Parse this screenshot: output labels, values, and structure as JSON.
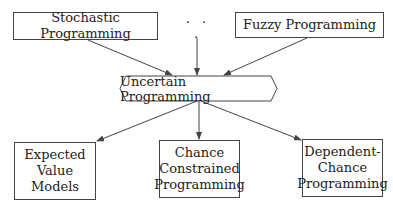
{
  "diagram": {
    "top_nodes": [
      {
        "id": "stochastic",
        "label": "Stochastic Programming"
      },
      {
        "id": "ellipsis",
        "label": "· · ·"
      },
      {
        "id": "fuzzy",
        "label": "Fuzzy Programming"
      }
    ],
    "center_node": {
      "id": "uncertain",
      "label": "Uncertain Programming",
      "shape": "hexagon"
    },
    "bottom_nodes": [
      {
        "id": "expected",
        "lines": [
          "Expected",
          "Value",
          "Models"
        ]
      },
      {
        "id": "chance",
        "lines": [
          "Chance",
          "Constrained",
          "Programming"
        ]
      },
      {
        "id": "dependent",
        "lines": [
          "Dependent-",
          "Chance",
          "Programming"
        ]
      }
    ],
    "edges": [
      {
        "from": "stochastic",
        "to": "uncertain"
      },
      {
        "from": "ellipsis",
        "to": "uncertain"
      },
      {
        "from": "fuzzy",
        "to": "uncertain"
      },
      {
        "from": "uncertain",
        "to": "expected"
      },
      {
        "from": "uncertain",
        "to": "chance"
      },
      {
        "from": "uncertain",
        "to": "dependent"
      }
    ],
    "colors": {
      "stroke": "#444444",
      "text": "#222222",
      "background": "#ffffff"
    }
  }
}
